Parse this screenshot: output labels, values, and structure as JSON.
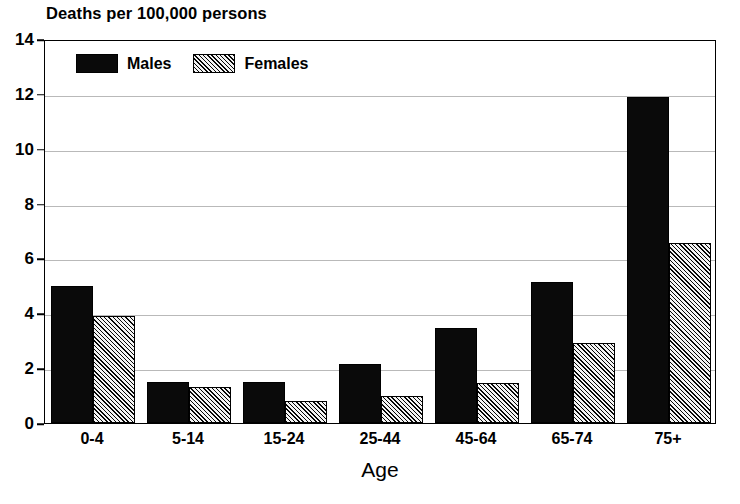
{
  "chart_data": {
    "type": "bar",
    "title": "Deaths per 100,000 persons",
    "xlabel": "Age",
    "ylabel": "",
    "categories": [
      "0-4",
      "5-14",
      "15-24",
      "25-44",
      "45-64",
      "65-74",
      "75+"
    ],
    "series": [
      {
        "name": "Males",
        "color": "#0a0a0a",
        "pattern": "solid",
        "values": [
          5.0,
          1.5,
          1.5,
          2.15,
          3.45,
          5.15,
          11.9
        ]
      },
      {
        "name": "Females",
        "color": "#8a8a8a",
        "pattern": "diagonal-hatch",
        "values": [
          3.9,
          1.3,
          0.8,
          1.0,
          1.45,
          2.9,
          6.55
        ]
      }
    ],
    "ylim": [
      0,
      14
    ],
    "yticks": [
      0,
      2,
      4,
      6,
      8,
      10,
      12,
      14
    ],
    "ytick_labels": [
      "0",
      "2",
      "4",
      "6",
      "8",
      "10",
      "12",
      "14"
    ],
    "grid": true,
    "legend_position": "top-left-inside",
    "legend_entries": [
      "Males",
      "Females"
    ]
  },
  "legend": {
    "males_label": "Males",
    "females_label": "Females"
  }
}
